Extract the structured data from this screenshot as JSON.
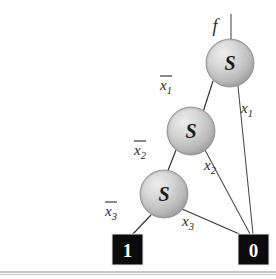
{
  "figure": {
    "root_label": "f",
    "node_symbol": "S",
    "terminal_one": "1",
    "terminal_zero": "0",
    "colors": {
      "node_fill_light": "#e6e6e6",
      "node_fill_mid": "#bfbfbf",
      "node_fill_dark": "#9a9a9a",
      "terminal_fill": "#0b0b0b",
      "terminal_text": "#ffffff",
      "edge_stroke": "#3a3a3a",
      "rule_stroke": "#8e8e8e",
      "background": "#fefefe"
    },
    "nodes": [
      {
        "name": "node-s-level1",
        "symbol": "S",
        "cx": 230,
        "cy": 63,
        "r": 24
      },
      {
        "name": "node-s-level2",
        "symbol": "S",
        "cx": 191,
        "cy": 131,
        "r": 24
      },
      {
        "name": "node-s-level3",
        "symbol": "S",
        "cx": 164,
        "cy": 194,
        "r": 24
      }
    ],
    "terminals": [
      {
        "name": "terminal-one",
        "value": "1",
        "x": 112,
        "y": 234,
        "w": 31,
        "h": 31
      },
      {
        "name": "terminal-zero",
        "value": "0",
        "x": 238,
        "y": 234,
        "w": 31,
        "h": 31
      }
    ],
    "edges": [
      {
        "name": "edge-x1-complement",
        "label_var": "x",
        "label_sub": "1",
        "negated": true,
        "label_x": 166,
        "label_y": 88,
        "from": "node-s-level1",
        "to": "node-s-level2"
      },
      {
        "name": "edge-x1",
        "label_var": "x",
        "label_sub": "1",
        "negated": false,
        "label_x": 245,
        "label_y": 113,
        "from": "node-s-level1",
        "to": "terminal-zero"
      },
      {
        "name": "edge-x2-complement",
        "label_var": "x",
        "label_sub": "2",
        "negated": true,
        "label_x": 140,
        "label_y": 155,
        "from": "node-s-level2",
        "to": "node-s-level3"
      },
      {
        "name": "edge-x2",
        "label_var": "x",
        "label_sub": "2",
        "negated": false,
        "label_x": 208,
        "label_y": 170,
        "from": "node-s-level2",
        "to": "terminal-zero"
      },
      {
        "name": "edge-x3-complement",
        "label_var": "x",
        "label_sub": "3",
        "negated": true,
        "label_x": 111,
        "label_y": 216,
        "from": "node-s-level3",
        "to": "terminal-one"
      },
      {
        "name": "edge-x3",
        "label_var": "x",
        "label_sub": "3",
        "negated": false,
        "label_x": 186,
        "label_y": 226,
        "from": "node-s-level3",
        "to": "terminal-zero"
      }
    ]
  }
}
